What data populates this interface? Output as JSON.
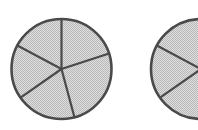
{
  "figure": {
    "background_color": "#ffffff",
    "width": 198,
    "height": 130
  },
  "style": {
    "fill_color": "#d2d2d2",
    "fill_texture": "dither-halftone",
    "fill_dot_color": "#b8b8b8",
    "outline_color": "#4a4a4a",
    "spoke_color": "#4a4a4a",
    "outline_width": 2.6,
    "spoke_width": 2.2
  },
  "chart_data": {
    "type": "pie",
    "xlabel": "",
    "ylabel": "",
    "charts": [
      {
        "name": "left-circle",
        "label": "Circle 1",
        "center_x": 61.5,
        "center_y": 69,
        "radius": 50,
        "clipped": false,
        "slice_count": 5,
        "categories": [
          "Sector 1",
          "Sector 2",
          "Sector 3",
          "Sector 4",
          "Sector 5"
        ],
        "values": [
          23,
          17,
          20,
          20,
          20
        ],
        "boundary_angles_deg": [
          18,
          90,
          152,
          215,
          285
        ],
        "slice_spans_deg": [
          72,
          62,
          63,
          70,
          93
        ]
      },
      {
        "name": "right-circle",
        "label": "Circle 2",
        "center_x": 201,
        "center_y": 69,
        "radius": 50,
        "clipped": true,
        "slice_count": 5,
        "categories": [
          "Sector 1",
          "Sector 2",
          "Sector 3",
          "Sector 4",
          "Sector 5"
        ],
        "values": [
          23,
          17,
          20,
          20,
          20
        ],
        "boundary_angles_deg": [
          18,
          90,
          152,
          215,
          285
        ],
        "slice_spans_deg": [
          72,
          62,
          63,
          70,
          93
        ]
      }
    ],
    "legend": [],
    "grid": false
  }
}
